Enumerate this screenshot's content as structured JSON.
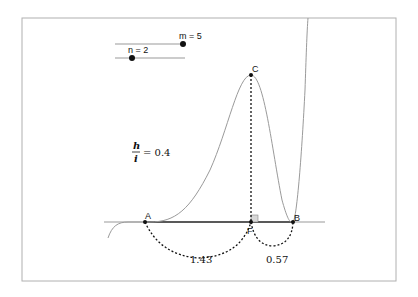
{
  "sliders": [
    {
      "label": "m = 5",
      "name": "m",
      "value": 5
    },
    {
      "label": "n = 2",
      "name": "n",
      "value": 2
    }
  ],
  "ratio": {
    "numerator": "h",
    "denominator": "i",
    "value": "= 0.4"
  },
  "points": {
    "A": "A",
    "B": "B",
    "C": "C",
    "F": "F"
  },
  "measurements": {
    "AF": "1.43",
    "FB": "0.57"
  },
  "colors": {
    "frame": "#b0b0b0",
    "curve": "#9a9a9a",
    "axis": "#333333",
    "point": "#111111",
    "right_angle": "#d8d8d8"
  }
}
